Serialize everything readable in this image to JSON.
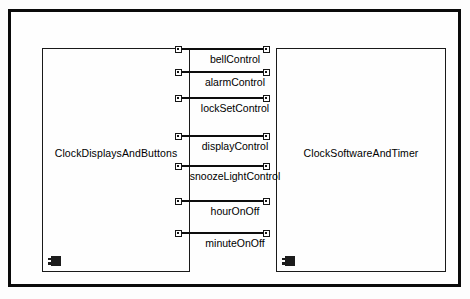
{
  "diagram": {
    "type": "component-diagram",
    "frame": {
      "name": "outer-frame"
    },
    "components": [
      {
        "id": "clock-displays-and-buttons",
        "label": "ClockDisplaysAndButtons",
        "icon": "uml-component-icon",
        "side": "left"
      },
      {
        "id": "clock-software-and-timer",
        "label": "ClockSoftwareAndTimer",
        "icon": "uml-component-icon",
        "side": "right"
      }
    ],
    "connectors": [
      {
        "label": "bellControl",
        "y": 48,
        "label_y": 53
      },
      {
        "label": "alarmControl",
        "y": 71,
        "label_y": 76
      },
      {
        "label": "lockSetControl",
        "y": 97,
        "label_y": 102
      },
      {
        "label": "displayControl",
        "y": 135,
        "label_y": 140
      },
      {
        "label": "snoozeLightControl",
        "y": 165,
        "label_y": 170
      },
      {
        "label": "hourOnOff",
        "y": 200,
        "label_y": 205
      },
      {
        "label": "minuteOnOff",
        "y": 232,
        "label_y": 237
      }
    ],
    "colors": {
      "frame_border": "#0a0a0a",
      "box_border": "#1a1a1a",
      "connector": "#0d0d0d",
      "text": "#000000",
      "background": "#fefefe"
    }
  }
}
